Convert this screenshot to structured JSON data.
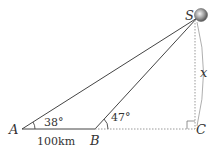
{
  "diagram": {
    "type": "trigonometry-triangle",
    "points": {
      "A": {
        "label": "A",
        "x": 22,
        "y": 129
      },
      "B": {
        "label": "B",
        "x": 95,
        "y": 129
      },
      "C": {
        "label": "C",
        "x": 195,
        "y": 129
      },
      "S": {
        "label": "S",
        "x": 195,
        "y": 16
      }
    },
    "angles": {
      "A": "38°",
      "B": "47°"
    },
    "segments": {
      "AB": "100km",
      "SC": "x"
    },
    "right_angle_at": "C",
    "colors": {
      "line": "#444444",
      "dotted": "#999999",
      "ball": "#888888"
    }
  }
}
